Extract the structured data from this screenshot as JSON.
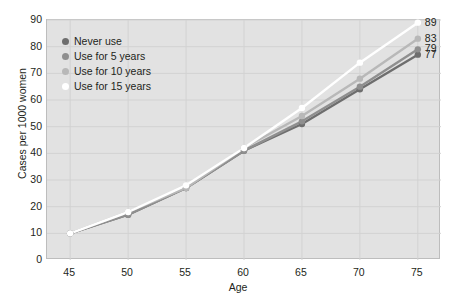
{
  "chart_data": {
    "type": "line",
    "title": "",
    "xlabel": "Age",
    "ylabel": "Cases per 1000 women",
    "x": [
      45,
      50,
      55,
      60,
      65,
      70,
      75
    ],
    "xlim": [
      43,
      77
    ],
    "ylim": [
      0,
      90
    ],
    "xticks": [
      "45",
      "50",
      "55",
      "60",
      "65",
      "70",
      "75"
    ],
    "yticks": [
      "0",
      "10",
      "20",
      "30",
      "40",
      "50",
      "60",
      "70",
      "80",
      "90"
    ],
    "grid": true,
    "legend_position": "top-left",
    "series": [
      {
        "name": "Never use",
        "color": "#6e6e6e",
        "values": [
          10,
          17,
          27,
          41,
          51,
          64,
          77
        ],
        "end_label": "77"
      },
      {
        "name": "Use for 5 years",
        "color": "#8f8f8f",
        "values": [
          10,
          17,
          27,
          41,
          52,
          65,
          79
        ],
        "end_label": "79"
      },
      {
        "name": "Use for 10 years",
        "color": "#b8b8b8",
        "values": [
          10,
          18,
          27,
          42,
          54,
          68,
          83
        ],
        "end_label": "83"
      },
      {
        "name": "Use for 15 years",
        "color": "#ffffff",
        "values": [
          10,
          18,
          28,
          42,
          57,
          74,
          89
        ],
        "end_label": "89"
      }
    ]
  },
  "colors": {
    "plot_background": "#e2e2e2",
    "page_background": "#ffffff",
    "gridline": "#d2d2d2",
    "axis_border": "#bdbdbd",
    "text": "#231f20"
  }
}
